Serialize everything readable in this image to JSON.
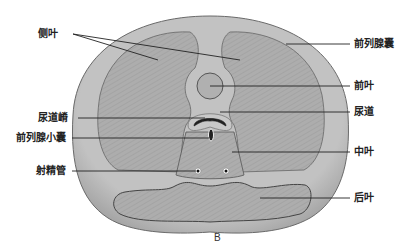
{
  "figure": {
    "panel_label": "B",
    "colors": {
      "capsule": "#b9b9b9",
      "lobe": "#a9a9a9",
      "outline": "#555555",
      "line": "#222222",
      "background": "#ffffff"
    }
  },
  "labels": {
    "lateral_lobe": "侧叶",
    "prostatic_capsule": "前列腺囊",
    "anterior_lobe": "前叶",
    "urethral_crest": "尿道嵴",
    "urethra": "尿道",
    "prostatic_utricle": "前列腺小囊",
    "median_lobe": "中叶",
    "ejaculatory_duct": "射精管",
    "posterior_lobe": "后叶"
  }
}
